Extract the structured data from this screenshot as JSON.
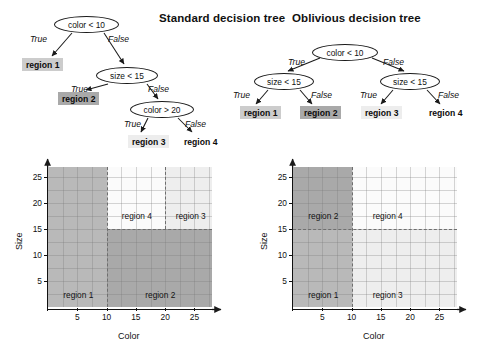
{
  "figure": {
    "caption_hidden": "",
    "colors": {
      "region1_fill": "#b9b9b9",
      "region2_fill": "#a9a9a9",
      "region3_fill": "#eeeeee",
      "region4_fill": "#fbfbfb",
      "leaf_box_region1": "#cccccc",
      "leaf_box_region2": "#a9a9a9",
      "leaf_box_region3": "#ededed",
      "leaf_box_region4": "#ffffff",
      "node_stroke": "#1a1a1a",
      "axis": "#111111",
      "grid": "rgba(120,120,120,0.30)"
    }
  },
  "standard_tree": {
    "title": "Standard decision tree",
    "nodes": [
      {
        "id": "root",
        "text": "color < 10"
      },
      {
        "id": "n2",
        "text": "size < 15"
      },
      {
        "id": "n3",
        "text": "color > 20"
      }
    ],
    "leaves": [
      {
        "id": "l1",
        "text": "region 1"
      },
      {
        "id": "l2",
        "text": "region 2"
      },
      {
        "id": "l3",
        "text": "region 3"
      },
      {
        "id": "l4",
        "text": "region 4"
      }
    ],
    "edge_labels": [
      {
        "id": "e1",
        "text": "True"
      },
      {
        "id": "e2",
        "text": "False"
      },
      {
        "id": "e3",
        "text": "True"
      },
      {
        "id": "e4",
        "text": "False"
      },
      {
        "id": "e5",
        "text": "True"
      },
      {
        "id": "e6",
        "text": "False"
      }
    ]
  },
  "oblivious_tree": {
    "title": "Oblivious decision tree",
    "nodes": [
      {
        "id": "root",
        "text": "color < 10"
      },
      {
        "id": "nL",
        "text": "size < 15"
      },
      {
        "id": "nR",
        "text": "size < 15"
      }
    ],
    "leaves": [
      {
        "id": "l1",
        "text": "region 1"
      },
      {
        "id": "l2",
        "text": "region 2"
      },
      {
        "id": "l3",
        "text": "region 3"
      },
      {
        "id": "l4",
        "text": "region 4"
      }
    ],
    "edge_labels": [
      {
        "id": "e1",
        "text": "True"
      },
      {
        "id": "e2",
        "text": "False"
      },
      {
        "id": "e3",
        "text": "True"
      },
      {
        "id": "e4",
        "text": "False"
      },
      {
        "id": "e5",
        "text": "True"
      },
      {
        "id": "e6",
        "text": "False"
      }
    ]
  },
  "chart_data": [
    {
      "type": "heatmap",
      "id": "standard_partition",
      "title": "",
      "xlabel": "Color",
      "ylabel": "Size",
      "xlim": [
        0,
        28
      ],
      "ylim": [
        0,
        27
      ],
      "xticks": [
        5,
        10,
        15,
        20,
        25
      ],
      "yticks": [
        5,
        10,
        15,
        20,
        25
      ],
      "grid": true,
      "regions": [
        {
          "label": "region 1",
          "x0": 0,
          "x1": 10,
          "y0": 0,
          "y1": 27,
          "fill": "#b9b9b9",
          "label_x": 5,
          "label_y": 1.6
        },
        {
          "label": "region 2",
          "x0": 10,
          "x1": 28,
          "y0": 0,
          "y1": 15,
          "fill": "#a9a9a9",
          "label_x": 19,
          "label_y": 1.6
        },
        {
          "label": "region 4",
          "x0": 10,
          "x1": 20,
          "y0": 15,
          "y1": 27,
          "fill": "#fbfbfb",
          "label_x": 15,
          "label_y": 16.8
        },
        {
          "label": "region 3",
          "x0": 20,
          "x1": 28,
          "y0": 15,
          "y1": 27,
          "fill": "#eeeeee",
          "label_x": 24.2,
          "label_y": 16.8
        }
      ],
      "boundaries": [
        {
          "kind": "v",
          "at": 10
        },
        {
          "kind": "h",
          "at": 15,
          "from": 10,
          "to": 28
        },
        {
          "kind": "v",
          "at": 20,
          "from": 15,
          "to": 27
        }
      ]
    },
    {
      "type": "heatmap",
      "id": "oblivious_partition",
      "title": "",
      "xlabel": "Color",
      "ylabel": "Size",
      "xlim": [
        0,
        28
      ],
      "ylim": [
        0,
        27
      ],
      "xticks": [
        5,
        10,
        15,
        20,
        25
      ],
      "yticks": [
        5,
        10,
        15,
        20,
        25
      ],
      "grid": true,
      "regions": [
        {
          "label": "region 1",
          "x0": 0,
          "x1": 10,
          "y0": 0,
          "y1": 15,
          "fill": "#b9b9b9",
          "label_x": 5,
          "label_y": 1.6
        },
        {
          "label": "region 2",
          "x0": 0,
          "x1": 10,
          "y0": 15,
          "y1": 27,
          "fill": "#a9a9a9",
          "label_x": 5,
          "label_y": 16.8
        },
        {
          "label": "region 3",
          "x0": 10,
          "x1": 28,
          "y0": 0,
          "y1": 15,
          "fill": "#eeeeee",
          "label_x": 16,
          "label_y": 1.6
        },
        {
          "label": "region 4",
          "x0": 10,
          "x1": 28,
          "y0": 15,
          "y1": 27,
          "fill": "#fbfbfb",
          "label_x": 16,
          "label_y": 16.8
        }
      ],
      "boundaries": [
        {
          "kind": "v",
          "at": 10
        },
        {
          "kind": "h",
          "at": 15,
          "from": 0,
          "to": 28
        }
      ]
    }
  ]
}
